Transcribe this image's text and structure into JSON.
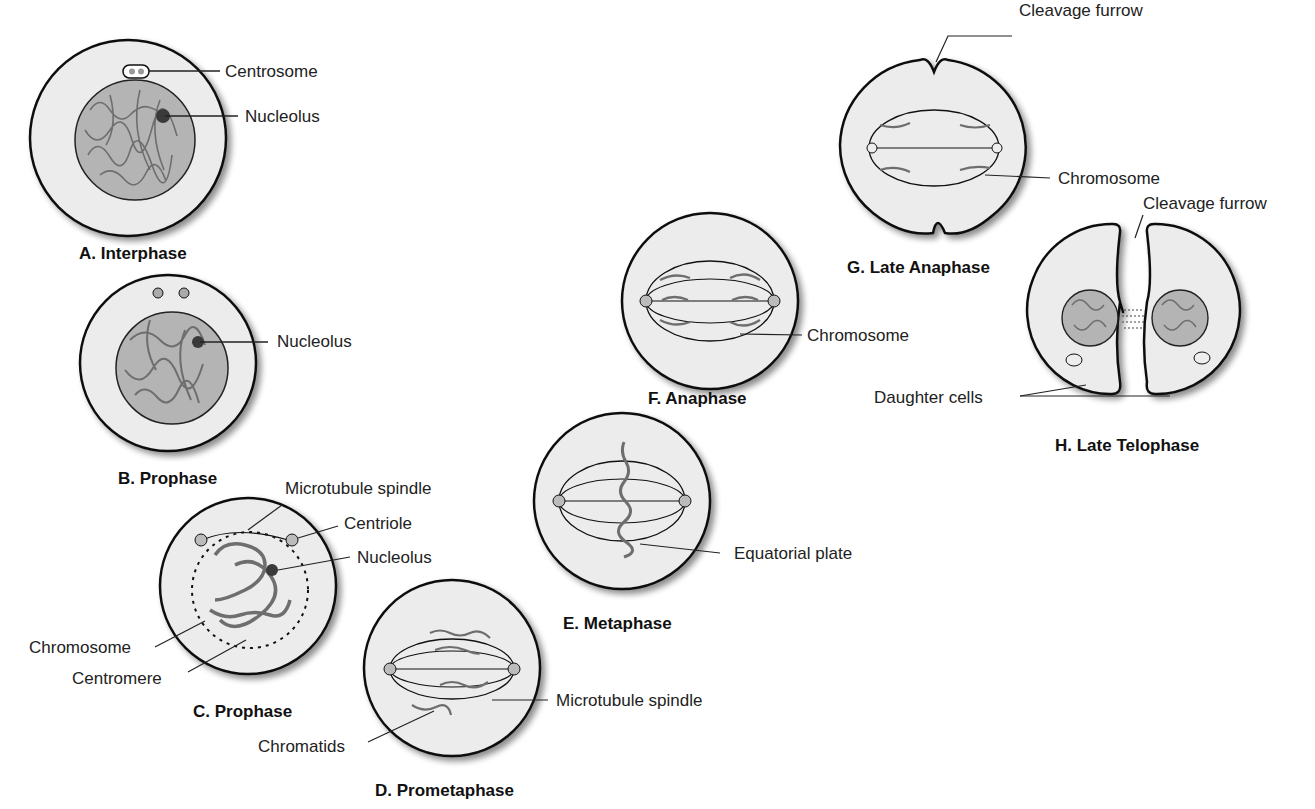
{
  "figure": {
    "colors": {
      "cell_fill": "#ececec",
      "nucleus_fill": "#b4b4b4",
      "chromatin": "#6e6e6e",
      "outline": "#111111",
      "nucleolus": "#3a3a3a"
    },
    "panels": [
      {
        "id": "A",
        "title": "A. Interphase",
        "labels": [
          "Centrosome",
          "Nucleolus"
        ]
      },
      {
        "id": "B",
        "title": "B. Prophase",
        "labels": [
          "Nucleolus"
        ]
      },
      {
        "id": "C",
        "title": "C. Prophase",
        "labels": [
          "Microtubule spindle",
          "Centriole",
          "Nucleolus",
          "Chromosome",
          "Centromere"
        ]
      },
      {
        "id": "D",
        "title": "D. Prometaphase",
        "labels": [
          "Microtubule spindle",
          "Chromatids"
        ]
      },
      {
        "id": "E",
        "title": "E. Metaphase",
        "labels": [
          "Equatorial plate"
        ]
      },
      {
        "id": "F",
        "title": "F. Anaphase",
        "labels": [
          "Chromosome"
        ]
      },
      {
        "id": "G",
        "title": "G. Late Anaphase",
        "labels": [
          "Cleavage furrow",
          "Chromosome"
        ]
      },
      {
        "id": "H",
        "title": "H. Late Telophase",
        "labels": [
          "Cleavage furrow",
          "Daughter cells"
        ]
      }
    ]
  }
}
